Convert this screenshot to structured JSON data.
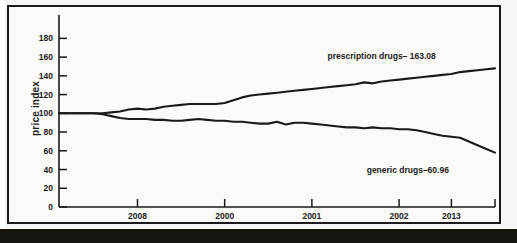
{
  "chart_data": {
    "type": "line",
    "title": "",
    "xlabel": "",
    "ylabel": "price index",
    "ylim": [
      0,
      190
    ],
    "xlim": [
      0,
      100
    ],
    "grid": false,
    "legend_position": "inline-annotation",
    "yticks": [
      0,
      20,
      40,
      60,
      80,
      100,
      120,
      140,
      160,
      180
    ],
    "ytick_labels": [
      "0",
      "20",
      "40",
      "60",
      "80",
      "100",
      "120",
      "140",
      "160",
      "180"
    ],
    "xticks": [
      18,
      38,
      58,
      78,
      90
    ],
    "xtick_labels": [
      "2008",
      "2000",
      "2001",
      "2002",
      "2013"
    ],
    "annotations": [
      {
        "name": "prescription-drugs-annotation",
        "text": "prescription drugs– 163.08",
        "x": 74,
        "y": 158
      },
      {
        "name": "generic-drugs-annotation",
        "text": "generic drugs–60.96",
        "x": 80,
        "y": 36
      }
    ],
    "series": [
      {
        "name": "prescription drugs",
        "end_label": "prescription drugs– 163.08",
        "end_value": 163.08,
        "x": [
          0,
          3,
          6,
          8,
          10,
          12,
          14,
          16,
          18,
          20,
          22,
          24,
          26,
          28,
          30,
          32,
          34,
          36,
          38,
          40,
          42,
          44,
          46,
          48,
          50,
          52,
          54,
          56,
          58,
          60,
          62,
          64,
          66,
          68,
          70,
          72,
          74,
          76,
          78,
          80,
          82,
          84,
          86,
          88,
          90,
          92,
          94,
          96,
          98,
          100
        ],
        "values": [
          100,
          100,
          100,
          100,
          100,
          101,
          102,
          104,
          105,
          104,
          105,
          107,
          108,
          109,
          110,
          110,
          110,
          110,
          111,
          114,
          117,
          119,
          120,
          121,
          122,
          123,
          124,
          125,
          126,
          127,
          128,
          129,
          130,
          131,
          133,
          132,
          134,
          135,
          136,
          137,
          138,
          139,
          140,
          141,
          142,
          144,
          145,
          146,
          147,
          148
        ]
      },
      {
        "name": "generic drugs",
        "end_label": "generic drugs–60.96",
        "end_value": 60.96,
        "x": [
          0,
          3,
          6,
          8,
          10,
          12,
          14,
          16,
          18,
          20,
          22,
          24,
          26,
          28,
          30,
          32,
          34,
          36,
          38,
          40,
          42,
          44,
          46,
          48,
          50,
          52,
          54,
          56,
          58,
          60,
          62,
          64,
          66,
          68,
          70,
          72,
          74,
          76,
          78,
          80,
          82,
          84,
          86,
          88,
          90,
          92,
          94,
          96,
          98,
          100
        ],
        "values": [
          100,
          100,
          100,
          100,
          99,
          97,
          95,
          94,
          94,
          94,
          93,
          93,
          92,
          92,
          93,
          94,
          93,
          92,
          92,
          91,
          91,
          90,
          89,
          89,
          91,
          88,
          90,
          90,
          89,
          88,
          87,
          86,
          85,
          85,
          84,
          85,
          84,
          84,
          83,
          83,
          82,
          80,
          78,
          76,
          75,
          74,
          70,
          66,
          62,
          58
        ]
      }
    ]
  },
  "figure": {
    "y_axis_title": "price index"
  }
}
